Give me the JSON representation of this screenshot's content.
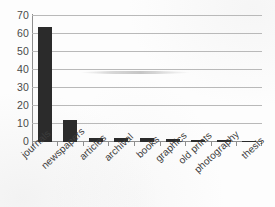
{
  "chart_data": {
    "type": "bar",
    "title": "",
    "subtitle": "",
    "xlabel": "",
    "ylabel": "",
    "categories": [
      "journals",
      "newspapers",
      "articles",
      "archival",
      "books",
      "graphics",
      "old prints",
      "photography",
      "thesis"
    ],
    "values": [
      64,
      12,
      2.5,
      2.2,
      2.2,
      1.4,
      1.1,
      0.9,
      0.8
    ],
    "series": [
      {
        "name": "count",
        "values": [
          64,
          12,
          2.5,
          2.2,
          2.2,
          1.4,
          1.1,
          0.9,
          0.8
        ]
      }
    ],
    "ylim": [
      0,
      70
    ],
    "ytick_labels": [
      "0",
      "10",
      "20",
      "30",
      "40",
      "50",
      "60",
      "70"
    ],
    "ytick_values": [
      0,
      10,
      20,
      30,
      40,
      50,
      60,
      70
    ],
    "grid": true,
    "grid_axis": "y",
    "legend": false,
    "legend_position": "none",
    "bar_color": "#2b2b2b",
    "gridline_color": "#b9b9b9",
    "axis_color": "#8e8e8e",
    "background_color": "#fdfdfd",
    "annotations": []
  }
}
